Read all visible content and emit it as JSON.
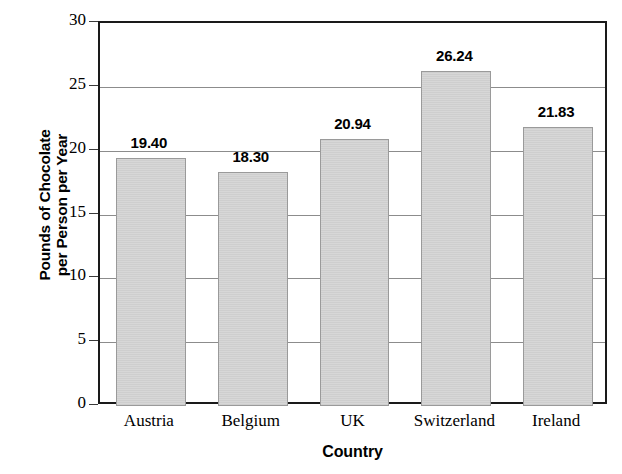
{
  "chart_data": {
    "type": "bar",
    "title": "",
    "subtitle": "",
    "xlabel": "Country",
    "ylabel": "Pounds of Chocolate per Person per Year",
    "ylabel_lines": [
      "Pounds of Chocolate",
      "per Person per Year"
    ],
    "categories": [
      "Austria",
      "Belgium",
      "UK",
      "Switzerland",
      "Ireland"
    ],
    "values": [
      19.4,
      18.3,
      20.94,
      26.24,
      21.83
    ],
    "value_labels": [
      "19.40",
      "18.30",
      "20.94",
      "26.24",
      "21.83"
    ],
    "ylim": [
      0,
      30
    ],
    "ytick_labels": [
      "0",
      "5",
      "10",
      "15",
      "20",
      "25",
      "30"
    ],
    "ytick_values": [
      0,
      5,
      10,
      15,
      20,
      25,
      30
    ],
    "grid": true,
    "grid_axis": "y",
    "legend": null,
    "legend_position": "none",
    "bar_fill_color": "#d7d7d7",
    "bar_border_color": "#9a9a9a",
    "axis_color": "#1a1a1a",
    "grid_color": "#8c8c8c",
    "background_color": "#ffffff",
    "text_color": "#000000"
  }
}
